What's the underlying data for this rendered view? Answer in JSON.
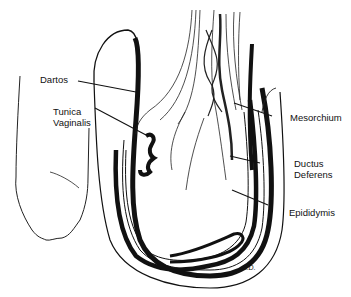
{
  "figure": {
    "type": "anatomical line illustration",
    "signature": "A.D."
  },
  "labels": {
    "dartos": "Dartos",
    "tunica_line1": "Tunica",
    "tunica_line2": "Vaginalis",
    "mesorchium": "Mesorchium",
    "ductus_line1": "Ductus",
    "ductus_line2": "Deferens",
    "epididymis": "Epididymis"
  },
  "colors": {
    "ink": "#111111",
    "background": "#ffffff"
  }
}
